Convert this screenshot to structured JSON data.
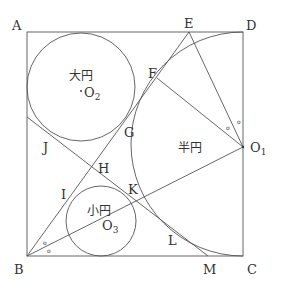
{
  "diagram": {
    "points": {
      "A": "A",
      "B": "B",
      "C": "C",
      "D": "D",
      "E": "E",
      "F": "F",
      "G": "G",
      "H": "H",
      "I": "I",
      "J": "J",
      "K": "K",
      "L": "L",
      "M": "M",
      "O1": "O",
      "O1_sub": "1",
      "O2": "O",
      "O2_sub": "2",
      "O3": "O",
      "O3_sub": "3"
    },
    "regions": {
      "large_circle": "大円",
      "semicircle": "半円",
      "small_circle": "小円"
    },
    "angle_mark": "o",
    "colors": {
      "stroke": "#555555",
      "text": "#333333"
    }
  }
}
